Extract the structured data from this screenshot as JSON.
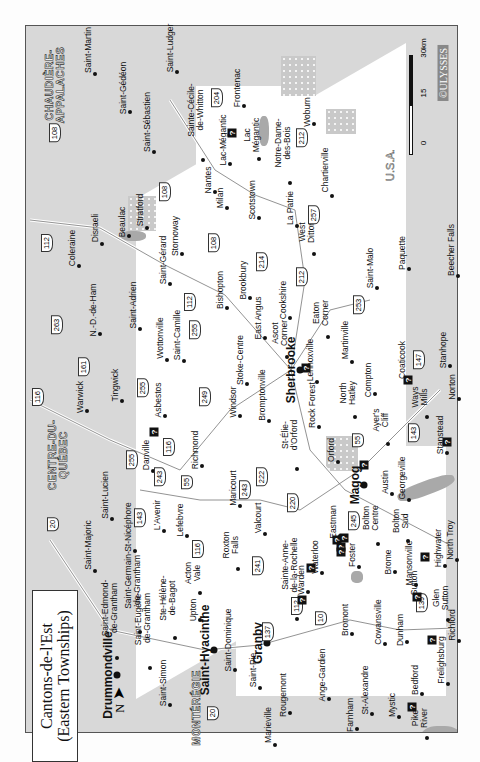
{
  "title": {
    "line1": "Cantons-de-l'Est",
    "line2": "(Eastern Townships)"
  },
  "north_label": "N",
  "scale": {
    "ticks": [
      "0",
      "15",
      "30km"
    ]
  },
  "brand": "©ULYSSES",
  "regions": {
    "chaudiere": "CHAUDIÈRE-\nAPPALACHES",
    "centre_quebec": "CENTRE-DU-\nQUÉBEC",
    "monteregie": "MONTÉRÉGIE",
    "usa": "U.S.A."
  },
  "cities": [
    {
      "name": "Sherbrooke",
      "x": 291,
      "y": 370,
      "big": true
    },
    {
      "name": "Drummondville",
      "x": 108,
      "y": 675,
      "big": true
    },
    {
      "name": "Saint-Hyacinthe",
      "x": 205,
      "y": 650,
      "big": true
    },
    {
      "name": "Granby",
      "x": 258,
      "y": 643,
      "big": true
    },
    {
      "name": "Magog",
      "x": 355,
      "y": 485,
      "big": true
    }
  ],
  "towns": [
    {
      "name": "Saint-Martin",
      "x": 88,
      "y": 50
    },
    {
      "name": "Saint-Gédéon",
      "x": 123,
      "y": 88
    },
    {
      "name": "Saint-Sébastien",
      "x": 147,
      "y": 122
    },
    {
      "name": "Saint-Ludger",
      "x": 170,
      "y": 48
    },
    {
      "name": "Sainte-Cécile-\nde-Whitton",
      "x": 196,
      "y": 110
    },
    {
      "name": "Frontenac",
      "x": 237,
      "y": 88
    },
    {
      "name": "Lac-Mégantic",
      "x": 223,
      "y": 140
    },
    {
      "name": "Lac\nMégantic",
      "x": 252,
      "y": 135
    },
    {
      "name": "Nantes",
      "x": 208,
      "y": 180
    },
    {
      "name": "Milan",
      "x": 220,
      "y": 198
    },
    {
      "name": "Woburn",
      "x": 307,
      "y": 112
    },
    {
      "name": "Notre-Dame-\ndes-Bois",
      "x": 283,
      "y": 143
    },
    {
      "name": "Chartierville",
      "x": 325,
      "y": 170
    },
    {
      "name": "Coleraine",
      "x": 72,
      "y": 248
    },
    {
      "name": "Disraeli",
      "x": 95,
      "y": 228
    },
    {
      "name": "Beaulac",
      "x": 122,
      "y": 222
    },
    {
      "name": "Stratford",
      "x": 140,
      "y": 210
    },
    {
      "name": "Stornoway",
      "x": 175,
      "y": 236
    },
    {
      "name": "Saint-Gérard",
      "x": 163,
      "y": 260
    },
    {
      "name": "Scotstown",
      "x": 252,
      "y": 200
    },
    {
      "name": "La Patrie",
      "x": 290,
      "y": 208
    },
    {
      "name": "West\nDitton",
      "x": 307,
      "y": 232
    },
    {
      "name": "N.-D.-de-Ham",
      "x": 93,
      "y": 310
    },
    {
      "name": "Saint-Adrien",
      "x": 133,
      "y": 305
    },
    {
      "name": "Bishopton",
      "x": 220,
      "y": 290
    },
    {
      "name": "Brookbury",
      "x": 243,
      "y": 280
    },
    {
      "name": "Scotstown",
      "x": 252,
      "y": 200,
      "skip": true
    },
    {
      "name": "Saint-Camille",
      "x": 177,
      "y": 335
    },
    {
      "name": "Wottonville",
      "x": 160,
      "y": 338
    },
    {
      "name": "East Angus",
      "x": 258,
      "y": 318
    },
    {
      "name": "Cookshire",
      "x": 283,
      "y": 300
    },
    {
      "name": "Ascot\nCorner",
      "x": 280,
      "y": 333
    },
    {
      "name": "Eaton\nCorner",
      "x": 321,
      "y": 313
    },
    {
      "name": "Saint-Malo",
      "x": 370,
      "y": 268
    },
    {
      "name": "Paquette",
      "x": 402,
      "y": 253
    },
    {
      "name": "Beecher Falls",
      "x": 451,
      "y": 250
    },
    {
      "name": "Warwick",
      "x": 80,
      "y": 397
    },
    {
      "name": "Tingwick",
      "x": 115,
      "y": 385
    },
    {
      "name": "Asbestos",
      "x": 158,
      "y": 400
    },
    {
      "name": "Danville",
      "x": 146,
      "y": 455
    },
    {
      "name": "Richmond",
      "x": 195,
      "y": 450
    },
    {
      "name": "Windsor",
      "x": 233,
      "y": 402
    },
    {
      "name": "Stoke-Centre",
      "x": 240,
      "y": 360
    },
    {
      "name": "Martinville",
      "x": 345,
      "y": 340
    },
    {
      "name": "Compton",
      "x": 368,
      "y": 380
    },
    {
      "name": "Coaticook",
      "x": 402,
      "y": 360
    },
    {
      "name": "Stanhope",
      "x": 443,
      "y": 350
    },
    {
      "name": "Norton",
      "x": 452,
      "y": 387
    },
    {
      "name": "Lennoxville",
      "x": 310,
      "y": 360
    },
    {
      "name": "Bromptonville",
      "x": 262,
      "y": 395
    },
    {
      "name": "Rock Forest",
      "x": 312,
      "y": 405
    },
    {
      "name": "North\nHatley",
      "x": 348,
      "y": 393
    },
    {
      "name": "Ayer's\nCliff",
      "x": 381,
      "y": 420
    },
    {
      "name": "Ways\nMills",
      "x": 420,
      "y": 397
    },
    {
      "name": "Stanstead",
      "x": 440,
      "y": 435
    },
    {
      "name": "St-Élie-\nd'Orford",
      "x": 290,
      "y": 435
    },
    {
      "name": "Orford",
      "x": 331,
      "y": 450
    },
    {
      "name": "Georgeville",
      "x": 402,
      "y": 478
    },
    {
      "name": "Austin",
      "x": 385,
      "y": 482
    },
    {
      "name": "Saint-Lucien",
      "x": 105,
      "y": 495
    },
    {
      "name": "Saint-Majoric",
      "x": 88,
      "y": 545
    },
    {
      "name": "St-Nicéphore",
      "x": 128,
      "y": 527
    },
    {
      "name": "L'Avenir",
      "x": 157,
      "y": 515
    },
    {
      "name": "Lefebvre",
      "x": 180,
      "y": 520
    },
    {
      "name": "Maricourt",
      "x": 233,
      "y": 488
    },
    {
      "name": "Valcourt",
      "x": 258,
      "y": 518
    },
    {
      "name": "Roxton\nFalls",
      "x": 231,
      "y": 545
    },
    {
      "name": "Acton\nVale",
      "x": 193,
      "y": 573
    },
    {
      "name": "Saint-Germain-\nde-Grantham",
      "x": 133,
      "y": 580
    },
    {
      "name": "Saint-Edmond-\nde-Grantham",
      "x": 110,
      "y": 608
    },
    {
      "name": "Saint-Eugène-\nde-Grantham",
      "x": 143,
      "y": 618
    },
    {
      "name": "Ste-Hélène-\nde-Bagot",
      "x": 168,
      "y": 598
    },
    {
      "name": "Upton",
      "x": 193,
      "y": 610
    },
    {
      "name": "Saint-Simon",
      "x": 163,
      "y": 683
    },
    {
      "name": "Saint-Dominique",
      "x": 228,
      "y": 640
    },
    {
      "name": "Saint-Pie",
      "x": 253,
      "y": 670
    },
    {
      "name": "Rougemont",
      "x": 283,
      "y": 695
    },
    {
      "name": "Marieville",
      "x": 268,
      "y": 725
    },
    {
      "name": "Ange-Gardien",
      "x": 322,
      "y": 675
    },
    {
      "name": "Farnham",
      "x": 350,
      "y": 715
    },
    {
      "name": "St-Alexandre",
      "x": 365,
      "y": 690
    },
    {
      "name": "Sainte-Anne-\nde-la-Rochelle",
      "x": 290,
      "y": 565
    },
    {
      "name": "Warden",
      "x": 301,
      "y": 580
    },
    {
      "name": "Waterloo",
      "x": 315,
      "y": 557
    },
    {
      "name": "Eastman",
      "x": 333,
      "y": 522
    },
    {
      "name": "Foster",
      "x": 352,
      "y": 555
    },
    {
      "name": "Bolton\nCentre",
      "x": 371,
      "y": 518
    },
    {
      "name": "Bolton\nSud",
      "x": 401,
      "y": 521
    },
    {
      "name": "Brome",
      "x": 388,
      "y": 562
    },
    {
      "name": "Mansonville",
      "x": 409,
      "y": 563
    },
    {
      "name": "Highwater",
      "x": 438,
      "y": 548
    },
    {
      "name": "North Troy",
      "x": 450,
      "y": 540
    },
    {
      "name": "Bromont",
      "x": 345,
      "y": 620
    },
    {
      "name": "Cowansville",
      "x": 378,
      "y": 622
    },
    {
      "name": "Dunham",
      "x": 400,
      "y": 630
    },
    {
      "name": "Sutton",
      "x": 414,
      "y": 583
    },
    {
      "name": "Glen\nSutton",
      "x": 441,
      "y": 598
    },
    {
      "name": "Richford",
      "x": 452,
      "y": 625
    },
    {
      "name": "Frelighsburg",
      "x": 441,
      "y": 660
    },
    {
      "name": "Bedford",
      "x": 415,
      "y": 680
    },
    {
      "name": "Mystic",
      "x": 392,
      "y": 705
    },
    {
      "name": "Pike\nRiver",
      "x": 420,
      "y": 718
    }
  ],
  "routes": [
    {
      "n": "108",
      "x": 55,
      "y": 133
    },
    {
      "n": "204",
      "x": 217,
      "y": 98
    },
    {
      "n": "108",
      "x": 165,
      "y": 192
    },
    {
      "n": "212",
      "x": 302,
      "y": 138
    },
    {
      "n": "257",
      "x": 314,
      "y": 215
    },
    {
      "n": "112",
      "x": 47,
      "y": 243
    },
    {
      "n": "108",
      "x": 214,
      "y": 243
    },
    {
      "n": "214",
      "x": 262,
      "y": 262
    },
    {
      "n": "212",
      "x": 302,
      "y": 277
    },
    {
      "n": "253",
      "x": 359,
      "y": 305
    },
    {
      "n": "112",
      "x": 190,
      "y": 302
    },
    {
      "n": "255",
      "x": 195,
      "y": 330
    },
    {
      "n": "263",
      "x": 57,
      "y": 325
    },
    {
      "n": "161",
      "x": 84,
      "y": 367
    },
    {
      "n": "116",
      "x": 38,
      "y": 397
    },
    {
      "n": "255",
      "x": 143,
      "y": 388
    },
    {
      "n": "249",
      "x": 205,
      "y": 397
    },
    {
      "n": "116",
      "x": 169,
      "y": 447
    },
    {
      "n": "255",
      "x": 132,
      "y": 460
    },
    {
      "n": "243",
      "x": 160,
      "y": 477
    },
    {
      "n": "55",
      "x": 187,
      "y": 482
    },
    {
      "n": "20",
      "x": 53,
      "y": 524
    },
    {
      "n": "143",
      "x": 140,
      "y": 518
    },
    {
      "n": "116",
      "x": 198,
      "y": 549
    },
    {
      "n": "243",
      "x": 245,
      "y": 490
    },
    {
      "n": "222",
      "x": 262,
      "y": 477
    },
    {
      "n": "220",
      "x": 293,
      "y": 503
    },
    {
      "n": "241",
      "x": 258,
      "y": 566
    },
    {
      "n": "245",
      "x": 354,
      "y": 521
    },
    {
      "n": "55",
      "x": 358,
      "y": 440
    },
    {
      "n": "143",
      "x": 414,
      "y": 433
    },
    {
      "n": "147",
      "x": 419,
      "y": 360
    },
    {
      "n": "112",
      "x": 297,
      "y": 606
    },
    {
      "n": "10",
      "x": 321,
      "y": 618
    },
    {
      "n": "137",
      "x": 268,
      "y": 632
    },
    {
      "n": "139",
      "x": 422,
      "y": 603
    },
    {
      "n": "20",
      "x": 213,
      "y": 713
    }
  ],
  "info_points": [
    {
      "x": 232,
      "y": 133
    },
    {
      "x": 154,
      "y": 432
    },
    {
      "x": 306,
      "y": 368
    },
    {
      "x": 364,
      "y": 465
    },
    {
      "x": 337,
      "y": 540
    },
    {
      "x": 341,
      "y": 547
    },
    {
      "x": 341,
      "y": 552
    },
    {
      "x": 311,
      "y": 568
    },
    {
      "x": 425,
      "y": 557
    },
    {
      "x": 302,
      "y": 600
    },
    {
      "x": 417,
      "y": 597
    },
    {
      "x": 432,
      "y": 640
    },
    {
      "x": 412,
      "y": 707
    },
    {
      "x": 408,
      "y": 380
    },
    {
      "x": 447,
      "y": 442
    },
    {
      "x": 344,
      "y": 538
    }
  ],
  "info_glyph": "?"
}
